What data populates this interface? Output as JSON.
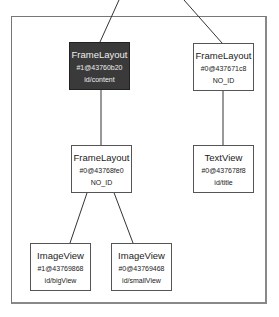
{
  "diagram": {
    "type": "view-hierarchy-tree",
    "nodes": [
      {
        "key": "n1",
        "class": "FrameLayout",
        "hash": "#1@43760b20",
        "id": "id/content",
        "selected": true
      },
      {
        "key": "n2",
        "class": "FrameLayout",
        "hash": "#0@437671c8",
        "id": "NO_ID",
        "selected": false
      },
      {
        "key": "n3",
        "class": "FrameLayout",
        "hash": "#0@43768fe0",
        "id": "NO_ID",
        "selected": false
      },
      {
        "key": "n4",
        "class": "TextView",
        "hash": "#0@437678f8",
        "id": "id/title",
        "selected": false
      },
      {
        "key": "n5",
        "class": "ImageView",
        "hash": "#1@43769868",
        "id": "id/bigView",
        "selected": false
      },
      {
        "key": "n6",
        "class": "ImageView",
        "hash": "#0@43769468",
        "id": "id/smallView",
        "selected": false
      }
    ],
    "edges": [
      [
        "parent",
        "n1"
      ],
      [
        "parent",
        "n2"
      ],
      [
        "n1",
        "n3"
      ],
      [
        "n2",
        "n4"
      ],
      [
        "n3",
        "n5"
      ],
      [
        "n3",
        "n6"
      ]
    ]
  }
}
